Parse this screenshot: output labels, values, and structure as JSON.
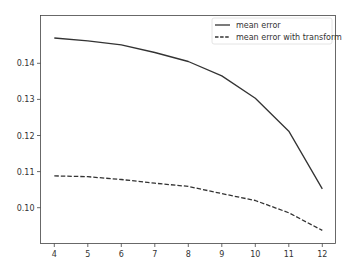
{
  "chart_data": {
    "type": "line",
    "title": "",
    "xlabel": "",
    "ylabel": "",
    "x": [
      4,
      5,
      6,
      7,
      8,
      9,
      10,
      11,
      12
    ],
    "series": [
      {
        "name": "mean error",
        "style": "solid",
        "color": "#333333",
        "values": [
          0.147,
          0.1462,
          0.1451,
          0.143,
          0.1405,
          0.1365,
          0.1303,
          0.1212,
          0.1052
        ]
      },
      {
        "name": "mean error with transform",
        "style": "dashed",
        "color": "#333333",
        "values": [
          0.1088,
          0.1086,
          0.1078,
          0.1068,
          0.1059,
          0.1039,
          0.102,
          0.0986,
          0.0937
        ]
      }
    ],
    "xticks": [
      4,
      5,
      6,
      7,
      8,
      9,
      10,
      11,
      12
    ],
    "xtick_labels": [
      "4",
      "5",
      "6",
      "7",
      "8",
      "9",
      "10",
      "11",
      "12"
    ],
    "yticks": [
      0.1,
      0.11,
      0.12,
      0.13,
      0.14
    ],
    "ytick_labels": [
      "0.10",
      "0.11",
      "0.12",
      "0.13",
      "0.14"
    ],
    "xlim": [
      3.6,
      12.4
    ],
    "ylim": [
      0.0916,
      0.1492
    ],
    "grid": false,
    "legend_position": "upper right"
  }
}
